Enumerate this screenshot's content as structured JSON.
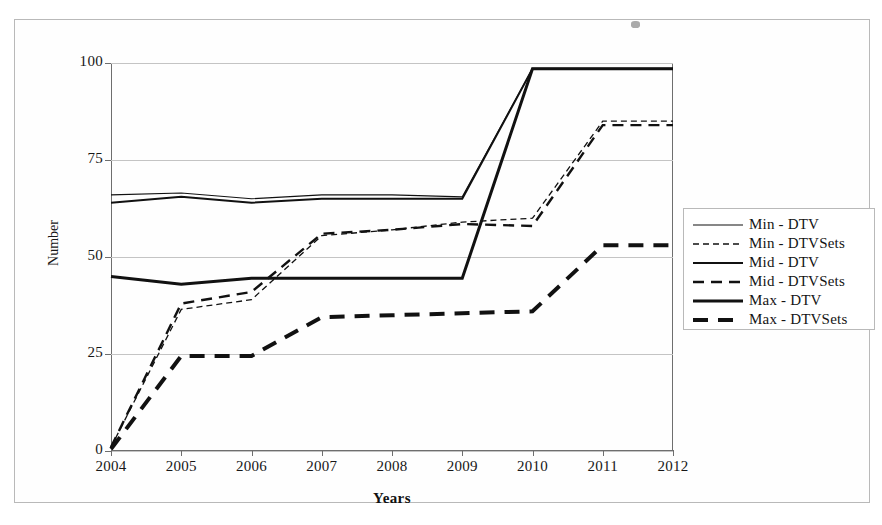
{
  "figure": {
    "y_axis_title": "Number",
    "x_axis_title": "Years"
  },
  "legend": {
    "entries": [
      {
        "label": "Min - DTV",
        "style": "thin-solid"
      },
      {
        "label": "Min - DTVSets",
        "style": "thin-dashed"
      },
      {
        "label": "Mid - DTV",
        "style": "medium-solid"
      },
      {
        "label": "Mid - DTVSets",
        "style": "medium-dashed"
      },
      {
        "label": "Max - DTV",
        "style": "bold-solid"
      },
      {
        "label": "Max - DTVSets",
        "style": "bold-dashed"
      }
    ]
  },
  "chart_data": {
    "type": "line",
    "title": "",
    "xlabel": "Years",
    "ylabel": "Number",
    "x": [
      2004,
      2005,
      2006,
      2007,
      2008,
      2009,
      2010,
      2011,
      2012
    ],
    "xlim": [
      2004,
      2012
    ],
    "ylim": [
      0,
      100
    ],
    "yticks": [
      0,
      25,
      50,
      75,
      100
    ],
    "xticks": [
      "2004",
      "2005",
      "2006",
      "2007",
      "2008",
      "2009",
      "2010",
      "2011",
      "2012"
    ],
    "grid": true,
    "legend_position": "right",
    "series": [
      {
        "name": "Min - DTV",
        "style": "thin-solid",
        "values": [
          66,
          66.5,
          65,
          66,
          66,
          65.5,
          98.5,
          98.5,
          98.5
        ]
      },
      {
        "name": "Min - DTVSets",
        "style": "thin-dashed",
        "values": [
          1,
          36.5,
          39,
          55.5,
          57,
          59,
          60,
          85,
          85
        ]
      },
      {
        "name": "Mid - DTV",
        "style": "medium-solid",
        "values": [
          64,
          65.5,
          64,
          65,
          65,
          65,
          98.5,
          98.5,
          98.5
        ]
      },
      {
        "name": "Mid - DTVSets",
        "style": "medium-dashed",
        "values": [
          1,
          38,
          41,
          56,
          57,
          58.5,
          58,
          84,
          84
        ]
      },
      {
        "name": "Max - DTV",
        "style": "bold-solid",
        "values": [
          45,
          43,
          44.5,
          44.5,
          44.5,
          44.5,
          98.5,
          98.5,
          98.5
        ]
      },
      {
        "name": "Max - DTVSets",
        "style": "bold-dashed",
        "values": [
          0.5,
          24.5,
          24.5,
          34.5,
          35,
          35.5,
          36,
          53,
          53
        ]
      }
    ]
  }
}
